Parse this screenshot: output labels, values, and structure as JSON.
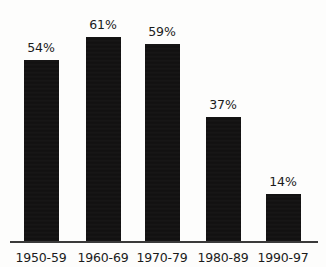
{
  "chart_data": {
    "type": "bar",
    "title": "",
    "xlabel": "",
    "ylabel": "",
    "ylim": [
      0,
      65
    ],
    "grid": false,
    "legend": "none",
    "categories": [
      "1950-59",
      "1960-69",
      "1970-79",
      "1980-89",
      "1990-97"
    ],
    "values": [
      54,
      61,
      59,
      37,
      14
    ],
    "value_labels": [
      "54%",
      "61%",
      "59%",
      "37%",
      "14%"
    ],
    "series": [
      {
        "name": "",
        "values": [
          54,
          61,
          59,
          37,
          14
        ]
      }
    ]
  },
  "colors": {
    "bar": "#111010",
    "axis": "#3a3a3a",
    "text": "#1b1b1b",
    "background": "#fdfdfc"
  },
  "geometry": {
    "baseline_y": 241,
    "axis_left": 10,
    "axis_right": 318,
    "bar_width": 35,
    "px_per_percent": 3.345,
    "bar_left": [
      24,
      86,
      145,
      206,
      266
    ],
    "label_center": [
      41,
      103,
      162,
      223,
      283
    ]
  }
}
